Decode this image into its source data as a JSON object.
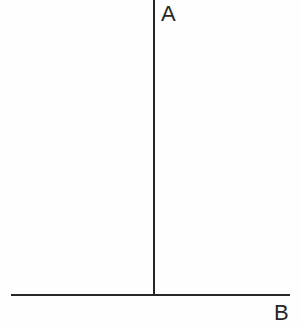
{
  "diagram": {
    "background_color": "#fefefe",
    "stroke_color": "#262626",
    "vertical_axis": {
      "label": "A",
      "name": "vertical-axis-line",
      "x": 154,
      "y_top": 0,
      "y_bottom": 295,
      "thickness": 2
    },
    "horizontal_axis": {
      "label": "B",
      "name": "horizontal-axis-line",
      "y": 295,
      "x_left": 11,
      "x_right": 290,
      "thickness": 2
    }
  },
  "chart_data": {
    "type": "line",
    "title": "",
    "subtitle": "",
    "xlabel": "B",
    "ylabel": "A",
    "x": [],
    "values": [],
    "categories": [],
    "series": [],
    "annotations": [
      "A",
      "B"
    ],
    "grid": false,
    "legend": "none",
    "xlim": [
      0,
      0
    ],
    "ylim": [
      0,
      0
    ]
  }
}
